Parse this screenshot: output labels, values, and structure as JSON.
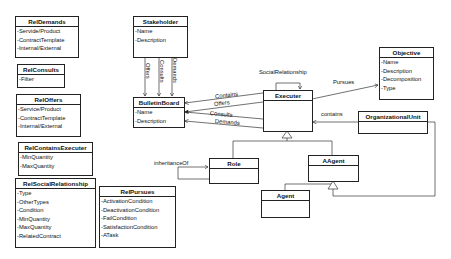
{
  "classes": {
    "relDemands": {
      "name": "RelDemands",
      "attrs": [
        "-Servide/Product",
        "-ContractTemplate",
        "-Internal/External"
      ]
    },
    "relConsults": {
      "name": "RelConsults",
      "attrs": [
        "-Filter"
      ]
    },
    "relOffers": {
      "name": "RelOffers",
      "attrs": [
        "-Service/Product",
        "-ContractTemplate",
        "-Internal/External"
      ]
    },
    "relContainsExecuter": {
      "name": "RelContainsExecuter",
      "attrs": [
        "-MinQuantity",
        "-MaxQuantity"
      ]
    },
    "relSocialRelationship": {
      "name": "RelSocialRelationship",
      "attrs": [
        "-Type",
        "-OtherTypes",
        "-Condition",
        "-MinQuantity",
        "-MaxQuantity",
        "-RelatedContract"
      ]
    },
    "relPursues": {
      "name": "RelPursues",
      "attrs": [
        "-ActivationCondition",
        "-DeactivationCondition",
        "-FailCondition",
        "-SatisfactionCondition",
        "-ATask"
      ]
    },
    "stakeholder": {
      "name": "Stakeholder",
      "attrs": [
        "-Name",
        "-Description"
      ]
    },
    "bulletinBoard": {
      "name": "BulletinBoard",
      "attrs": [
        "-Name",
        "-Description"
      ]
    },
    "executer": {
      "name": "Executer",
      "attrs": []
    },
    "objective": {
      "name": "Objective",
      "attrs": [
        "-Name",
        "-Description",
        "-Decomposition",
        "-Type"
      ]
    },
    "organizationalUnit": {
      "name": "OrganizationalUnit",
      "attrs": []
    },
    "role": {
      "name": "Role",
      "attrs": []
    },
    "aagent": {
      "name": "AAgent",
      "attrs": []
    },
    "agent": {
      "name": "Agent",
      "attrs": []
    }
  },
  "relations": {
    "offers_sb": "Offers",
    "consults_sb": "Consults",
    "demands_sb": "Demands",
    "contains_eb": "Contains",
    "offers_eb": "Offers",
    "consults_eb": "Consults",
    "demands_eb": "Demands",
    "social": "SocialRelationship",
    "pursues": "Pursues",
    "contains_ou": "contains",
    "inheritanceOf": "inheritanceOf"
  }
}
